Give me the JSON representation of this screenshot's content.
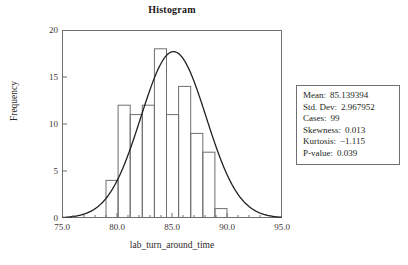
{
  "chart_data": {
    "type": "bar",
    "title": "Histogram",
    "xlabel": "lab_turn_around_time",
    "ylabel": "Frequency",
    "xlim": [
      75.0,
      95.0
    ],
    "ylim": [
      0,
      20
    ],
    "xticks": [
      "75.0",
      "80.0",
      "85.0",
      "90.0",
      "95.0"
    ],
    "xtick_values": [
      75.0,
      80.0,
      85.0,
      90.0,
      95.0
    ],
    "yticks": [
      "0",
      "5",
      "10",
      "15",
      "20"
    ],
    "ytick_values": [
      0,
      5,
      10,
      15,
      20
    ],
    "grid": false,
    "legend": "none",
    "bin_width": 1.1,
    "bin_starts": [
      79.0,
      80.1,
      81.2,
      82.3,
      83.4,
      84.5,
      85.6,
      86.7,
      87.8,
      88.9
    ],
    "bin_edges": [
      79.0,
      80.1,
      81.2,
      82.3,
      83.4,
      84.5,
      85.6,
      86.7,
      87.8,
      88.9,
      90.0
    ],
    "categories": [
      "79.0-80.1",
      "80.1-81.2",
      "81.2-82.3",
      "82.3-83.4",
      "83.4-84.5",
      "84.5-85.6",
      "85.6-86.7",
      "86.7-87.8",
      "87.8-88.9",
      "88.9-90.0"
    ],
    "values": [
      4,
      12,
      11,
      12,
      18,
      11,
      14,
      9,
      7,
      1
    ],
    "overlay": {
      "type": "normal-curve",
      "mean": 85.139394,
      "std_dev": 2.967952,
      "peak_height": 17.7,
      "description": "fitted normal distribution curve"
    }
  },
  "chart": {
    "title": "Histogram",
    "x_axis_title": "lab_turn_around_time",
    "y_axis_title": "Frequency"
  },
  "stats": {
    "rows": [
      {
        "label": "Mean:",
        "value": "85.139394"
      },
      {
        "label": "Std. Dev:",
        "value": "2.967952"
      },
      {
        "label": "Cases:",
        "value": "99"
      },
      {
        "label": "Skewness:",
        "value": "0.013"
      },
      {
        "label": "Kurtosis:",
        "value": "−1.115"
      },
      {
        "label": "P-value:",
        "value": "0.039"
      }
    ]
  },
  "colors": {
    "axis": "#6f6f6f",
    "bar_outline": "#6f6f6f",
    "curve": "#231f20",
    "text": "#231f20",
    "background": "#ffffff"
  }
}
